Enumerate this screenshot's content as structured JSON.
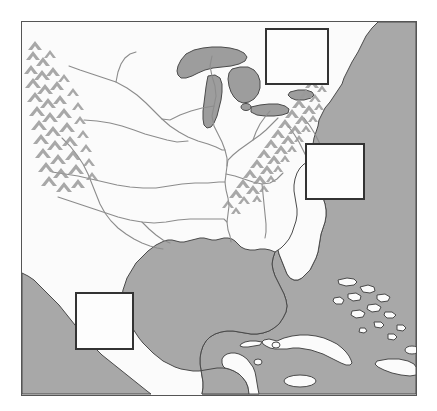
{
  "image": {
    "kind": "reference-map",
    "width": 437,
    "height": 411,
    "title": "Map of eastern North America, Gulf of Mexico and Caribbean",
    "background_color": "#ffffff"
  },
  "map": {
    "frame": {
      "x": 21,
      "y": 21,
      "width": 396,
      "height": 375,
      "border_color": "#555555",
      "border_width_px": 1
    },
    "colors": {
      "land": "#fbfbfb",
      "ocean": "#a8a8a8",
      "lake": "#9d9d9d",
      "coastline": "#4a4a4a",
      "river": "#8c8c8c",
      "mountain_shading": "#9a9a9a",
      "box_border": "#333333",
      "box_fill": "#fdfdfd"
    },
    "features": {
      "water_bodies": [
        "Atlantic Ocean",
        "Pacific Ocean",
        "Gulf of Mexico",
        "Caribbean Sea",
        "Lake Superior",
        "Lake Michigan",
        "Lake Huron",
        "Lake Erie",
        "Lake Ontario"
      ],
      "rivers": [
        "Mississippi River",
        "Missouri River",
        "Ohio River",
        "Arkansas River",
        "Red River",
        "Rio Grande",
        "Tennessee River"
      ],
      "mountain_ranges": [
        "Rocky Mountains",
        "Appalachian Mountains"
      ],
      "islands": [
        "Cuba",
        "Jamaica",
        "Hispaniola",
        "Bahamas"
      ],
      "peninsulas": [
        "Florida",
        "Yucatan",
        "Baja California"
      ]
    },
    "highlight_boxes": [
      {
        "id": "box-great-lakes",
        "region": "Great Lakes / Lake Erie area",
        "x": 265,
        "y": 28,
        "width": 64,
        "height": 57
      },
      {
        "id": "box-carolinas",
        "region": "Carolinas / southern Appalachians",
        "x": 305,
        "y": 143,
        "width": 60,
        "height": 57
      },
      {
        "id": "box-northern-mexico",
        "region": "Northern Mexico / western Gulf coast",
        "x": 75,
        "y": 292,
        "width": 59,
        "height": 58
      }
    ]
  }
}
